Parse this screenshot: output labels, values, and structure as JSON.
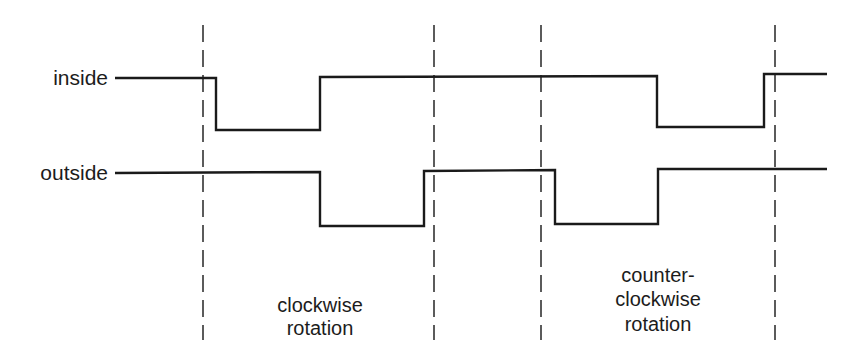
{
  "diagram": {
    "type": "quadrature-timing-diagram",
    "signals": [
      {
        "name": "inside",
        "label": "inside",
        "label_pos": [
          108,
          85
        ],
        "points": [
          [
            115,
            78
          ],
          [
            216,
            78
          ],
          [
            216,
            130
          ],
          [
            320,
            130
          ],
          [
            320,
            77
          ],
          [
            657,
            76
          ],
          [
            657,
            127
          ],
          [
            764,
            127
          ],
          [
            764,
            74
          ],
          [
            827,
            74
          ]
        ]
      },
      {
        "name": "outside",
        "label": "outside",
        "label_pos": [
          108,
          180
        ],
        "points": [
          [
            115,
            173
          ],
          [
            320,
            172
          ],
          [
            320,
            226
          ],
          [
            424,
            226
          ],
          [
            424,
            171
          ],
          [
            555,
            170
          ],
          [
            555,
            224
          ],
          [
            658,
            224
          ],
          [
            658,
            169
          ],
          [
            827,
            169
          ]
        ]
      }
    ],
    "markers": [
      {
        "x": 203,
        "y1": 25,
        "y2": 340
      },
      {
        "x": 434,
        "y1": 25,
        "y2": 340
      },
      {
        "x": 541,
        "y1": 25,
        "y2": 340
      },
      {
        "x": 775,
        "y1": 25,
        "y2": 340
      }
    ],
    "phases": [
      {
        "name": "clockwise",
        "center_x": 320,
        "lines": [
          {
            "text": "clockwise",
            "y": 312
          },
          {
            "text": "rotation",
            "y": 335
          }
        ]
      },
      {
        "name": "counter-clockwise",
        "center_x": 658,
        "lines": [
          {
            "text": "counter-",
            "y": 282
          },
          {
            "text": "clockwise",
            "y": 306
          },
          {
            "text": "rotation",
            "y": 331
          }
        ]
      }
    ],
    "colors": {
      "line": "#1a1a1a",
      "text": "#1c1c1c",
      "background": "#ffffff"
    }
  }
}
